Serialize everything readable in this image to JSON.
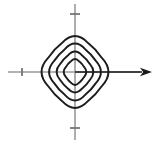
{
  "figure": {
    "background_color": "#ffffff",
    "width": 158,
    "height": 144
  },
  "colors": {
    "curve_stroke": "#1c1c1c",
    "axis_stroke": "#9a9a9a",
    "tick_stroke": "#6e6e6e",
    "arrow_fill": "#1a1a1a"
  },
  "axes": {
    "origin": {
      "x": 75,
      "y": 72
    },
    "x_axis": {
      "name": "horizontal-axis",
      "label": "",
      "x_start": 8,
      "x_end": 152,
      "y": 72,
      "has_arrow": true,
      "arrow_direction": "right",
      "arrow_tip_x": 152,
      "arrow_base_x": 140
    },
    "y_axis": {
      "name": "vertical-axis",
      "label": "",
      "y_start": 4,
      "y_end": 140,
      "x": 75,
      "has_arrow": false
    },
    "ticks": [
      {
        "id": "tick-x-negative",
        "axis": "x",
        "x": 22,
        "y": 72,
        "half_length": 4,
        "orientation": "vertical",
        "label": ""
      },
      {
        "id": "tick-y-positive",
        "axis": "y",
        "x": 75,
        "y": 14,
        "half_length": 5,
        "orientation": "horizontal",
        "label": ""
      },
      {
        "id": "tick-y-negative",
        "axis": "y",
        "x": 75,
        "y": 128,
        "half_length": 5,
        "orientation": "horizontal",
        "label": ""
      }
    ]
  },
  "chart_data": {
    "type": "line",
    "subtitle": "",
    "xlabel": "",
    "ylabel": "",
    "xlim": [
      -75,
      83
    ],
    "ylim": [
      -72,
      72
    ],
    "grid": false,
    "legend": null,
    "legend_position": "none",
    "annotations": [],
    "tick_labels": {
      "x": [],
      "y": []
    },
    "center": {
      "x": 75,
      "y": 72
    },
    "curve_family": "rounded-diamond superellipse level sets",
    "curve_count": 4,
    "superellipse_exponent": 1.55,
    "corner_roundness": 0.42,
    "series": [
      {
        "name": "level-curve-1",
        "order": 1,
        "description": "innermost rounded diamond",
        "half_width": 13.5,
        "half_height": 15.5,
        "vertices": [
          {
            "label": "right",
            "x": 88.5,
            "y": 72
          },
          {
            "label": "top",
            "x": 75,
            "y": 56.5
          },
          {
            "label": "left",
            "x": 61.5,
            "y": 72
          },
          {
            "label": "bottom",
            "x": 75,
            "y": 87.5
          }
        ]
      },
      {
        "name": "level-curve-2",
        "order": 2,
        "description": "second rounded diamond",
        "half_width": 22,
        "half_height": 24.5,
        "vertices": [
          {
            "label": "right",
            "x": 97,
            "y": 72
          },
          {
            "label": "top",
            "x": 75,
            "y": 47.5
          },
          {
            "label": "left",
            "x": 53,
            "y": 72
          },
          {
            "label": "bottom",
            "x": 75,
            "y": 96.5
          }
        ]
      },
      {
        "name": "level-curve-3",
        "order": 3,
        "description": "third rounded diamond",
        "half_width": 31,
        "half_height": 34,
        "vertices": [
          {
            "label": "right",
            "x": 106,
            "y": 72
          },
          {
            "label": "top",
            "x": 75,
            "y": 38
          },
          {
            "label": "left",
            "x": 44,
            "y": 72
          },
          {
            "label": "bottom",
            "x": 75,
            "y": 106
          }
        ]
      },
      {
        "name": "level-curve-4",
        "order": 4,
        "description": "outermost rounded diamond",
        "half_width": 40,
        "half_height": 43,
        "vertices": [
          {
            "label": "right",
            "x": 115,
            "y": 72
          },
          {
            "label": "top",
            "x": 75,
            "y": 29
          },
          {
            "label": "left",
            "x": 35,
            "y": 72
          },
          {
            "label": "bottom",
            "x": 75,
            "y": 115
          }
        ]
      }
    ]
  }
}
